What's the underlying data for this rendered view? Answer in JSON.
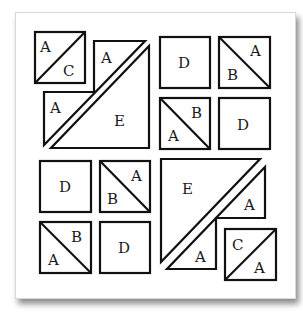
{
  "diagram": {
    "type": "quilt-block-cutting-diagram",
    "stroke_color": "#111111",
    "fill_color": "#ffffff",
    "quadrants": {
      "top_left": {
        "pieces": [
          {
            "shape": "half-square-triangle-box",
            "labels": [
              "A",
              "C"
            ]
          },
          {
            "shape": "triangle",
            "label": "A"
          },
          {
            "shape": "triangle",
            "label": "A"
          },
          {
            "shape": "large-triangle",
            "label": "E"
          }
        ]
      },
      "top_right": {
        "pieces": [
          {
            "shape": "square",
            "label": "D"
          },
          {
            "shape": "half-square-triangle-box",
            "labels": [
              "A",
              "B"
            ]
          },
          {
            "shape": "half-square-triangle-box",
            "labels": [
              "B",
              "A"
            ]
          },
          {
            "shape": "square",
            "label": "D"
          }
        ]
      },
      "bottom_left": {
        "pieces": [
          {
            "shape": "square",
            "label": "D"
          },
          {
            "shape": "half-square-triangle-box",
            "labels": [
              "A",
              "B"
            ]
          },
          {
            "shape": "half-square-triangle-box",
            "labels": [
              "B",
              "A"
            ]
          },
          {
            "shape": "square",
            "label": "D"
          }
        ]
      },
      "bottom_right": {
        "pieces": [
          {
            "shape": "large-triangle",
            "label": "E"
          },
          {
            "shape": "triangle",
            "label": "A"
          },
          {
            "shape": "triangle",
            "label": "A"
          },
          {
            "shape": "half-square-triangle-box",
            "labels": [
              "C",
              "A"
            ]
          }
        ]
      }
    },
    "labels": {
      "tl_box_a": "A",
      "tl_box_c": "C",
      "tl_tri_upper_a": "A",
      "tl_tri_lower_a": "A",
      "tl_e": "E",
      "tr_d1": "D",
      "tr_box1_a": "A",
      "tr_box1_b": "B",
      "tr_box2_b": "B",
      "tr_box2_a": "A",
      "tr_d2": "D",
      "bl_d1": "D",
      "bl_box1_a": "A",
      "bl_box1_b": "B",
      "bl_box2_b": "B",
      "bl_box2_a": "A",
      "bl_d2": "D",
      "br_e": "E",
      "br_tri_upper_a": "A",
      "br_tri_lower_a": "A",
      "br_box_c": "C",
      "br_box_a": "A"
    }
  }
}
